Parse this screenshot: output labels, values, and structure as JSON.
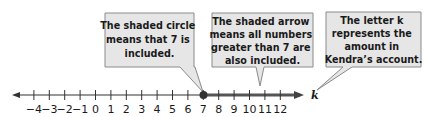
{
  "diagram": {
    "type": "number-line-inequality",
    "variable": "k",
    "number_line": {
      "min": -4,
      "max": 12,
      "tick_labels": [
        "−4",
        "−3",
        "−2",
        "−1",
        "0",
        "1",
        "2",
        "3",
        "4",
        "5",
        "6",
        "7",
        "8",
        "9",
        "10",
        "11",
        "12"
      ],
      "closed_point": 7,
      "shaded_direction": "right",
      "left_arrow": true,
      "right_arrow": true
    },
    "callouts": [
      {
        "id": "closed-circle",
        "lines": [
          "The shaded circle",
          "means that 7 is",
          "included."
        ]
      },
      {
        "id": "shaded-arrow",
        "lines": [
          "The shaded arrow",
          "means all numbers",
          "greater than 7 are",
          "also included."
        ]
      },
      {
        "id": "variable-k",
        "lines": [
          "The letter k",
          "represents the",
          "amount in",
          "Kendra’s account."
        ]
      }
    ],
    "colors": {
      "callout_fill": "#e6e6e6",
      "callout_border": "#8a8a8a",
      "line": "#333333",
      "shaded": "#555555"
    }
  }
}
